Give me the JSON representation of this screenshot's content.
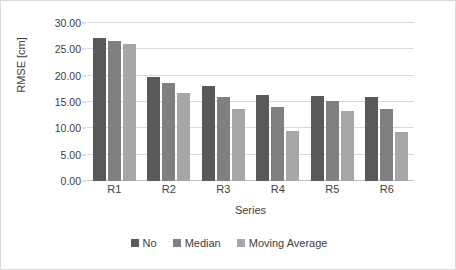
{
  "chart_data": {
    "type": "bar",
    "title": "",
    "xlabel": "Series",
    "ylabel": "RMSE [cm]",
    "categories": [
      "R1",
      "R2",
      "R3",
      "R4",
      "R5",
      "R6"
    ],
    "series": [
      {
        "name": "No",
        "color": "#595959",
        "values": [
          27.1,
          19.7,
          18.0,
          16.3,
          16.2,
          16.0
        ]
      },
      {
        "name": "Median",
        "color": "#808080",
        "values": [
          26.6,
          18.7,
          16.0,
          14.0,
          15.1,
          13.6
        ]
      },
      {
        "name": "Moving Average",
        "color": "#a6a6a6",
        "values": [
          26.1,
          16.8,
          13.6,
          9.5,
          13.3,
          9.3
        ]
      }
    ],
    "ylim": [
      0,
      30
    ],
    "ytick_step": 5,
    "ytick_labels": [
      "0.00",
      "5.00",
      "10.00",
      "15.00",
      "20.00",
      "25.00",
      "30.00"
    ],
    "ytick_values": [
      0,
      5,
      10,
      15,
      20,
      25,
      30
    ],
    "grid": true,
    "legend_position": "bottom"
  }
}
